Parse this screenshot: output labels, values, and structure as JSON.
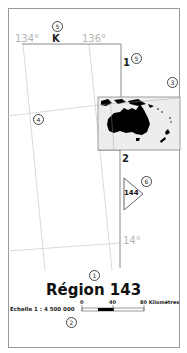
{
  "map": {
    "title": "Région 143",
    "grid_labels": {
      "lon_left": "134°",
      "lon_right": "136°",
      "lat_bottom": "14°"
    },
    "zone_letter": "K",
    "sheet_numbers": {
      "top": "1",
      "middle": "2"
    },
    "adjacent_region": "144",
    "scale": {
      "text": "Échelle 1 : 4 500 000",
      "ticks": [
        "0",
        "40",
        "80 Kilomètres"
      ]
    },
    "callouts": {
      "title": "1",
      "scale": "2",
      "inset": "3",
      "grid": "4",
      "zone_letter": "5",
      "sheet_number": "5",
      "adjacent": "6"
    },
    "inset": {
      "description": "Locator map of Australia and surrounding region"
    },
    "colors": {
      "frame": "#9a9a9a",
      "grid": "#c8c8c8",
      "boundary": "#888888",
      "land": "#000000",
      "inset_bg": "#eeeeee"
    }
  }
}
